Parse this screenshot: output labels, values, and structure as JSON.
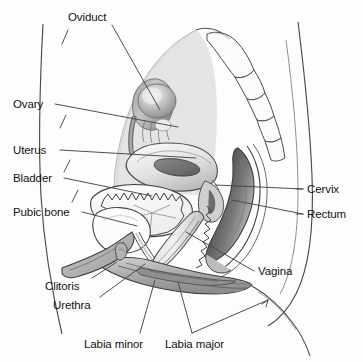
{
  "figure": {
    "background_color": "#fdfdfd",
    "label_color": "#121212",
    "leader_line_color": "#3a3a3a",
    "outline_color": "#3c3c3c"
  },
  "palette": {
    "abdominal_cavity_fill": "#e3e3e3",
    "organ_light": "#f2f2f2",
    "organ_mid": "#c9c9c9",
    "organ_dark": "#8f8f8f",
    "organ_darkest": "#5a5a5a",
    "bone_fill": "#fbfbfb",
    "labia_fill": "#b4b4b4",
    "white": "#ffffff"
  },
  "labels": [
    {
      "id": "oviduct",
      "text": "Oviduct",
      "x": 68,
      "y": 11,
      "align": "left",
      "anchor_x": 112,
      "anchor_y": 25,
      "target_x": 160,
      "target_y": 110
    },
    {
      "id": "ovary",
      "text": "Ovary",
      "x": 13,
      "y": 98,
      "align": "left",
      "anchor_x": 55,
      "anchor_y": 104,
      "target_x": 178,
      "target_y": 127
    },
    {
      "id": "uterus",
      "text": "Uterus",
      "x": 13,
      "y": 144,
      "align": "left",
      "anchor_x": 60,
      "anchor_y": 150,
      "target_x": 196,
      "target_y": 158
    },
    {
      "id": "bladder",
      "text": "Bladder",
      "x": 13,
      "y": 172,
      "align": "left",
      "anchor_x": 64,
      "anchor_y": 178,
      "target_x": 152,
      "target_y": 196
    },
    {
      "id": "pubic-bone",
      "text": "Pubic bone",
      "x": 13,
      "y": 206,
      "align": "left",
      "anchor_x": 82,
      "anchor_y": 212,
      "target_x": 137,
      "target_y": 226
    },
    {
      "id": "clitoris",
      "text": "Clitoris",
      "x": 45,
      "y": 280,
      "align": "left",
      "anchor_x": 92,
      "anchor_y": 278,
      "target_x": 117,
      "target_y": 262
    },
    {
      "id": "urethra",
      "text": "Urethra",
      "x": 53,
      "y": 299,
      "align": "left",
      "anchor_x": 100,
      "anchor_y": 297,
      "target_x": 145,
      "target_y": 264
    },
    {
      "id": "labia-minor",
      "text": "Labia minor",
      "x": 84,
      "y": 338,
      "align": "left",
      "anchor_x": 140,
      "anchor_y": 333,
      "target_x": 155,
      "target_y": 280
    },
    {
      "id": "labia-major",
      "text": "Labia major",
      "x": 165,
      "y": 338,
      "align": "left",
      "anchor_x": 192,
      "anchor_y": 333,
      "target_x": 178,
      "target_y": 282
    },
    {
      "id": "cervix",
      "text": "Cervix",
      "x": 307,
      "y": 183,
      "align": "left",
      "anchor_x": 303,
      "anchor_y": 189,
      "target_x": 215,
      "target_y": 185
    },
    {
      "id": "rectum",
      "text": "Rectum",
      "x": 307,
      "y": 208,
      "align": "left",
      "anchor_x": 303,
      "anchor_y": 214,
      "target_x": 232,
      "target_y": 200
    },
    {
      "id": "vagina",
      "text": "Vagina",
      "x": 258,
      "y": 265,
      "align": "left",
      "anchor_x": 254,
      "anchor_y": 271,
      "target_x": 186,
      "target_y": 232
    }
  ],
  "structures": [
    {
      "id": "abdominal-cavity",
      "name": "abdominal-cavity"
    },
    {
      "id": "sacrum-coccyx",
      "name": "sacrum-and-coccyx"
    },
    {
      "id": "ovary-body",
      "name": "ovary"
    },
    {
      "id": "oviduct-tube",
      "name": "oviduct-fallopian-tube"
    },
    {
      "id": "uterus-body",
      "name": "uterus"
    },
    {
      "id": "uterine-cavity",
      "name": "uterine-cavity"
    },
    {
      "id": "bladder-body",
      "name": "urinary-bladder"
    },
    {
      "id": "bladder-rugae",
      "name": "bladder-rugae"
    },
    {
      "id": "pubic-bone-body",
      "name": "pubic-bone"
    },
    {
      "id": "urethra-canal",
      "name": "urethra"
    },
    {
      "id": "vaginal-canal",
      "name": "vagina"
    },
    {
      "id": "cervix-body",
      "name": "cervix"
    },
    {
      "id": "rectum-body",
      "name": "rectum"
    },
    {
      "id": "anal-canal",
      "name": "anal-canal"
    },
    {
      "id": "labia-majora-fold",
      "name": "labia-majora"
    },
    {
      "id": "labia-minora-fold",
      "name": "labia-minora"
    },
    {
      "id": "clitoris-body",
      "name": "clitoris"
    },
    {
      "id": "body-outline-front",
      "name": "anterior-abdominal-wall"
    },
    {
      "id": "body-outline-back",
      "name": "posterior-buttock-outline"
    },
    {
      "id": "thigh-outline",
      "name": "thigh-outline"
    }
  ]
}
